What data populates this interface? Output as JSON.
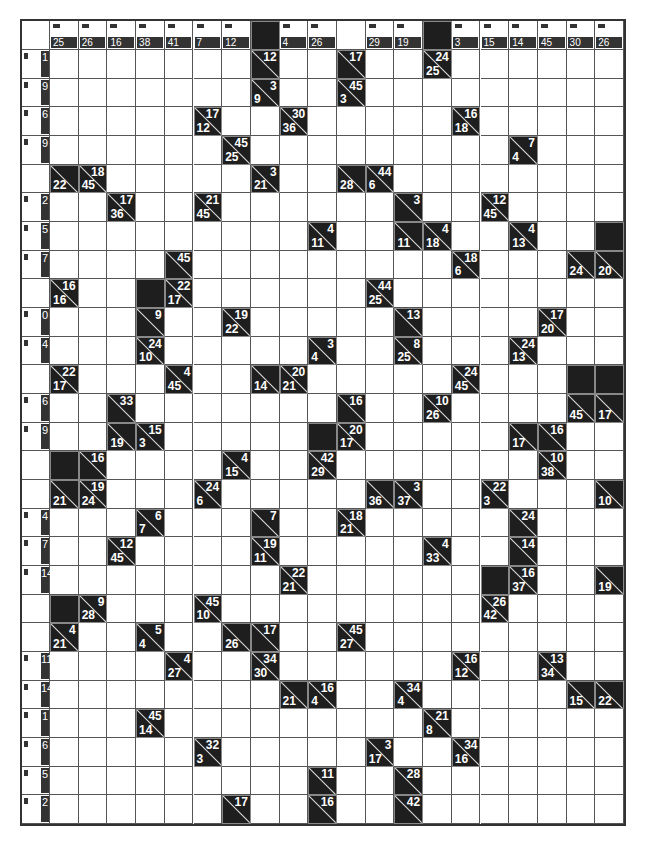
{
  "puzzle": {
    "type": "kakuro",
    "cols": 21,
    "rows": 28,
    "top_header": [
      "",
      "25",
      "26",
      "16",
      "38",
      "41",
      "7",
      "12",
      "#",
      "4",
      "26",
      "",
      "29",
      "19",
      "#",
      "3",
      "15",
      "14",
      "45",
      "30",
      "26"
    ],
    "left_header": [
      "",
      "1",
      "9",
      "6",
      "9",
      "",
      "2",
      "5",
      "7",
      "",
      "0",
      "4",
      "",
      "6",
      "9",
      "",
      "",
      "4",
      "7",
      "14",
      "",
      "",
      "11",
      "14",
      "1",
      "6",
      "5",
      "2"
    ],
    "clues": [
      {
        "r": 1,
        "c": 8,
        "down": "12",
        "across": ""
      },
      {
        "r": 1,
        "c": 11,
        "down": "17",
        "across": ""
      },
      {
        "r": 1,
        "c": 14,
        "down": "24",
        "across": "25"
      },
      {
        "r": 2,
        "c": 8,
        "down": "3",
        "across": "9"
      },
      {
        "r": 2,
        "c": 11,
        "down": "45",
        "across": "3"
      },
      {
        "r": 3,
        "c": 6,
        "down": "17",
        "across": "12"
      },
      {
        "r": 3,
        "c": 9,
        "down": "30",
        "across": "36"
      },
      {
        "r": 3,
        "c": 15,
        "down": "16",
        "across": "18"
      },
      {
        "r": 4,
        "c": 7,
        "down": "45",
        "across": "25"
      },
      {
        "r": 4,
        "c": 17,
        "down": "7",
        "across": "4"
      },
      {
        "r": 5,
        "c": 1,
        "down": "",
        "across": "22"
      },
      {
        "r": 5,
        "c": 2,
        "down": "18",
        "across": "45"
      },
      {
        "r": 5,
        "c": 8,
        "down": "3",
        "across": "21"
      },
      {
        "r": 5,
        "c": 11,
        "down": "",
        "across": "28"
      },
      {
        "r": 5,
        "c": 12,
        "down": "44",
        "across": "6"
      },
      {
        "r": 6,
        "c": 3,
        "down": "17",
        "across": "36"
      },
      {
        "r": 6,
        "c": 6,
        "down": "21",
        "across": "45"
      },
      {
        "r": 6,
        "c": 13,
        "down": "3",
        "across": ""
      },
      {
        "r": 6,
        "c": 16,
        "down": "12",
        "across": "45"
      },
      {
        "r": 7,
        "c": 10,
        "down": "4",
        "across": "11"
      },
      {
        "r": 7,
        "c": 13,
        "down": "",
        "across": "11"
      },
      {
        "r": 7,
        "c": 14,
        "down": "4",
        "across": "18"
      },
      {
        "r": 7,
        "c": 17,
        "down": "4",
        "across": "13"
      },
      {
        "r": 8,
        "c": 5,
        "down": "45",
        "across": ""
      },
      {
        "r": 8,
        "c": 15,
        "down": "18",
        "across": "6"
      },
      {
        "r": 8,
        "c": 19,
        "down": "",
        "across": "24"
      },
      {
        "r": 8,
        "c": 20,
        "down": "",
        "across": "20"
      },
      {
        "r": 9,
        "c": 1,
        "down": "16",
        "across": "16"
      },
      {
        "r": 9,
        "c": 5,
        "down": "22",
        "across": "17"
      },
      {
        "r": 9,
        "c": 12,
        "down": "44",
        "across": "25"
      },
      {
        "r": 10,
        "c": 4,
        "down": "9",
        "across": ""
      },
      {
        "r": 10,
        "c": 7,
        "down": "19",
        "across": "22"
      },
      {
        "r": 10,
        "c": 13,
        "down": "13",
        "across": ""
      },
      {
        "r": 10,
        "c": 18,
        "down": "17",
        "across": "20"
      },
      {
        "r": 11,
        "c": 4,
        "down": "24",
        "across": "10"
      },
      {
        "r": 11,
        "c": 10,
        "down": "3",
        "across": "4"
      },
      {
        "r": 11,
        "c": 13,
        "down": "8",
        "across": "25"
      },
      {
        "r": 11,
        "c": 17,
        "down": "24",
        "across": "13"
      },
      {
        "r": 12,
        "c": 1,
        "down": "22",
        "across": "17"
      },
      {
        "r": 12,
        "c": 5,
        "down": "4",
        "across": "45"
      },
      {
        "r": 12,
        "c": 8,
        "down": "",
        "across": "14"
      },
      {
        "r": 12,
        "c": 9,
        "down": "20",
        "across": "21"
      },
      {
        "r": 12,
        "c": 15,
        "down": "24",
        "across": "45"
      },
      {
        "r": 13,
        "c": 3,
        "down": "33",
        "across": ""
      },
      {
        "r": 13,
        "c": 11,
        "down": "16",
        "across": ""
      },
      {
        "r": 13,
        "c": 14,
        "down": "10",
        "across": "26"
      },
      {
        "r": 13,
        "c": 19,
        "down": "",
        "across": "45"
      },
      {
        "r": 13,
        "c": 20,
        "down": "",
        "across": "17"
      },
      {
        "r": 14,
        "c": 3,
        "down": "",
        "across": "19"
      },
      {
        "r": 14,
        "c": 4,
        "down": "15",
        "across": "3"
      },
      {
        "r": 14,
        "c": 11,
        "down": "20",
        "across": "17"
      },
      {
        "r": 14,
        "c": 17,
        "down": "",
        "across": "17"
      },
      {
        "r": 14,
        "c": 18,
        "down": "16",
        "across": ""
      },
      {
        "r": 15,
        "c": 2,
        "down": "16",
        "across": ""
      },
      {
        "r": 15,
        "c": 7,
        "down": "4",
        "across": "15"
      },
      {
        "r": 15,
        "c": 10,
        "down": "42",
        "across": "29"
      },
      {
        "r": 15,
        "c": 18,
        "down": "10",
        "across": "38"
      },
      {
        "r": 16,
        "c": 1,
        "down": "",
        "across": "21"
      },
      {
        "r": 16,
        "c": 2,
        "down": "19",
        "across": "24"
      },
      {
        "r": 16,
        "c": 6,
        "down": "24",
        "across": "6"
      },
      {
        "r": 16,
        "c": 12,
        "down": "",
        "across": "36"
      },
      {
        "r": 16,
        "c": 13,
        "down": "3",
        "across": "37"
      },
      {
        "r": 16,
        "c": 16,
        "down": "22",
        "across": "3"
      },
      {
        "r": 16,
        "c": 20,
        "down": "",
        "across": "10"
      },
      {
        "r": 17,
        "c": 4,
        "down": "6",
        "across": "7"
      },
      {
        "r": 17,
        "c": 8,
        "down": "7",
        "across": ""
      },
      {
        "r": 17,
        "c": 11,
        "down": "18",
        "across": "21"
      },
      {
        "r": 17,
        "c": 17,
        "down": "24",
        "across": ""
      },
      {
        "r": 18,
        "c": 3,
        "down": "12",
        "across": "45"
      },
      {
        "r": 18,
        "c": 8,
        "down": "19",
        "across": "11"
      },
      {
        "r": 18,
        "c": 14,
        "down": "4",
        "across": "33"
      },
      {
        "r": 18,
        "c": 17,
        "down": "14",
        "across": ""
      },
      {
        "r": 19,
        "c": 9,
        "down": "22",
        "across": "21"
      },
      {
        "r": 19,
        "c": 17,
        "down": "16",
        "across": "37"
      },
      {
        "r": 19,
        "c": 20,
        "down": "",
        "across": "19"
      },
      {
        "r": 20,
        "c": 2,
        "down": "9",
        "across": "28"
      },
      {
        "r": 20,
        "c": 6,
        "down": "45",
        "across": "10"
      },
      {
        "r": 20,
        "c": 16,
        "down": "26",
        "across": "42"
      },
      {
        "r": 21,
        "c": 1,
        "down": "4",
        "across": "21"
      },
      {
        "r": 21,
        "c": 4,
        "down": "5",
        "across": "4"
      },
      {
        "r": 21,
        "c": 7,
        "down": "",
        "across": "26"
      },
      {
        "r": 21,
        "c": 8,
        "down": "17",
        "across": ""
      },
      {
        "r": 21,
        "c": 11,
        "down": "45",
        "across": "27"
      },
      {
        "r": 22,
        "c": 5,
        "down": "4",
        "across": "27"
      },
      {
        "r": 22,
        "c": 8,
        "down": "34",
        "across": "30"
      },
      {
        "r": 22,
        "c": 15,
        "down": "16",
        "across": "12"
      },
      {
        "r": 22,
        "c": 18,
        "down": "13",
        "across": "34"
      },
      {
        "r": 23,
        "c": 9,
        "down": "",
        "across": "21"
      },
      {
        "r": 23,
        "c": 10,
        "down": "16",
        "across": "4"
      },
      {
        "r": 23,
        "c": 13,
        "down": "34",
        "across": "4"
      },
      {
        "r": 23,
        "c": 19,
        "down": "",
        "across": "15"
      },
      {
        "r": 23,
        "c": 20,
        "down": "",
        "across": "22"
      },
      {
        "r": 24,
        "c": 4,
        "down": "45",
        "across": "14"
      },
      {
        "r": 24,
        "c": 14,
        "down": "21",
        "across": "8"
      },
      {
        "r": 25,
        "c": 6,
        "down": "32",
        "across": "3"
      },
      {
        "r": 25,
        "c": 12,
        "down": "3",
        "across": "17"
      },
      {
        "r": 25,
        "c": 15,
        "down": "34",
        "across": "16"
      },
      {
        "r": 26,
        "c": 10,
        "down": "11",
        "across": ""
      },
      {
        "r": 26,
        "c": 13,
        "down": "28",
        "across": ""
      },
      {
        "r": 27,
        "c": 7,
        "down": "17",
        "across": ""
      },
      {
        "r": 27,
        "c": 10,
        "down": "16",
        "across": ""
      },
      {
        "r": 27,
        "c": 13,
        "down": "42",
        "across": ""
      }
    ],
    "black": [
      {
        "r": 7,
        "c": 20
      },
      {
        "r": 9,
        "c": 4
      },
      {
        "r": 12,
        "c": 19
      },
      {
        "r": 12,
        "c": 20
      },
      {
        "r": 14,
        "c": 10
      },
      {
        "r": 15,
        "c": 1
      },
      {
        "r": 19,
        "c": 16
      },
      {
        "r": 20,
        "c": 1
      }
    ],
    "colors": {
      "clue_bg": "#1e1e1e",
      "clue_text": "#ffffff",
      "grid_line": "#555555",
      "cell_bg": "#ffffff"
    }
  }
}
